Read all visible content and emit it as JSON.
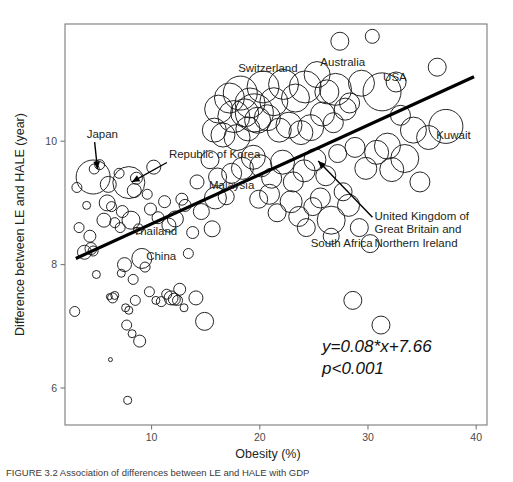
{
  "figure": {
    "caption": "FIGURE 3.2   Association of differences between LE and HALE with GDP",
    "equation_line1": "y=0.08*x+7.66",
    "equation_line2": "p<0.001"
  },
  "chart_data": {
    "type": "scatter",
    "title": "",
    "xlabel": "Obesity (%)",
    "ylabel": "Difference between LE and HALE (year)",
    "xlim": [
      2.0,
      41.0
    ],
    "ylim": [
      5.4,
      11.9
    ],
    "xticks": [
      10,
      20,
      30,
      40
    ],
    "yticks": [
      6,
      8,
      10
    ],
    "xtick_labels": [
      "10",
      "20",
      "30",
      "40"
    ],
    "ytick_labels": [
      "6",
      "8",
      "10"
    ],
    "grid": false,
    "bubble_size_note": "marker area encodes a third variable (population/GDP)",
    "trendline": {
      "slope": 0.08,
      "intercept": 7.66,
      "x_start": 3.0,
      "x_end": 39.8,
      "label": "y=0.08*x+7.66",
      "p_value": "p<0.001",
      "color": "#000000"
    },
    "annotations": [
      {
        "text": "Japan",
        "x": 4.0,
        "y": 10.05,
        "arrow_to_x": 5.0,
        "arrow_to_y": 9.55
      },
      {
        "text": "Republic of Korea",
        "x": 11.6,
        "y": 9.72,
        "arrow_to_x": 8.2,
        "arrow_to_y": 9.34
      },
      {
        "text": "Malaysia",
        "x": 15.3,
        "y": 9.22,
        "arrow_to_x": null,
        "arrow_to_y": null
      },
      {
        "text": "Thailand",
        "x": 8.3,
        "y": 8.48,
        "arrow_to_x": null,
        "arrow_to_y": null
      },
      {
        "text": "China",
        "x": 9.5,
        "y": 8.08,
        "arrow_to_x": null,
        "arrow_to_y": null
      },
      {
        "text": "Switzerland",
        "x": 18.0,
        "y": 11.12,
        "arrow_to_x": null,
        "arrow_to_y": null
      },
      {
        "text": "Australia",
        "x": 25.6,
        "y": 11.22,
        "arrow_to_x": null,
        "arrow_to_y": null
      },
      {
        "text": "USA",
        "x": 31.4,
        "y": 10.98,
        "arrow_to_x": null,
        "arrow_to_y": null
      },
      {
        "text": "Kuwait",
        "x": 36.3,
        "y": 10.04,
        "arrow_to_x": null,
        "arrow_to_y": null
      },
      {
        "text": "United Kingdom of Great Britain and Northern Ireland",
        "x": 30.6,
        "y": 8.72,
        "arrow_to_x": 25.4,
        "arrow_to_y": 9.68
      },
      {
        "text": "South Africa",
        "x": 24.7,
        "y": 8.28,
        "arrow_to_x": null,
        "arrow_to_y": null
      }
    ],
    "named_points": [
      {
        "name": "Japan",
        "x": 4.6,
        "y": 9.42,
        "r": 17
      },
      {
        "name": "Republic of Korea",
        "x": 7.9,
        "y": 9.33,
        "r": 16
      },
      {
        "name": "Malaysia",
        "x": 15.9,
        "y": 9.08,
        "r": 11
      },
      {
        "name": "Thailand",
        "x": 8.1,
        "y": 8.72,
        "r": 9
      },
      {
        "name": "China",
        "x": 9.1,
        "y": 8.1,
        "r": 10
      },
      {
        "name": "Switzerland",
        "x": 19.5,
        "y": 10.46,
        "r": 19
      },
      {
        "name": "Australia",
        "x": 27.0,
        "y": 10.84,
        "r": 16
      },
      {
        "name": "USA",
        "x": 31.3,
        "y": 10.8,
        "r": 19
      },
      {
        "name": "Kuwait",
        "x": 37.2,
        "y": 10.24,
        "r": 17
      },
      {
        "name": "United Kingdom",
        "x": 26.6,
        "y": 8.72,
        "r": 14
      },
      {
        "name": "South Africa",
        "x": 24.3,
        "y": 8.6,
        "r": 9
      }
    ],
    "points": [
      {
        "x": 3.1,
        "y": 9.25,
        "r": 5
      },
      {
        "x": 3.3,
        "y": 8.6,
        "r": 5
      },
      {
        "x": 2.9,
        "y": 7.24,
        "r": 5
      },
      {
        "x": 4.0,
        "y": 8.96,
        "r": 4
      },
      {
        "x": 4.3,
        "y": 8.46,
        "r": 6
      },
      {
        "x": 4.4,
        "y": 8.26,
        "r": 6
      },
      {
        "x": 3.8,
        "y": 8.2,
        "r": 7
      },
      {
        "x": 4.6,
        "y": 8.22,
        "r": 5
      },
      {
        "x": 4.7,
        "y": 9.55,
        "r": 5
      },
      {
        "x": 5.2,
        "y": 9.62,
        "r": 5
      },
      {
        "x": 4.9,
        "y": 7.84,
        "r": 4
      },
      {
        "x": 5.6,
        "y": 8.72,
        "r": 7
      },
      {
        "x": 5.9,
        "y": 9.0,
        "r": 8
      },
      {
        "x": 6.0,
        "y": 9.3,
        "r": 8
      },
      {
        "x": 6.3,
        "y": 8.94,
        "r": 5
      },
      {
        "x": 6.6,
        "y": 8.68,
        "r": 5
      },
      {
        "x": 6.1,
        "y": 7.48,
        "r": 3
      },
      {
        "x": 6.4,
        "y": 7.46,
        "r": 5
      },
      {
        "x": 6.6,
        "y": 7.5,
        "r": 4
      },
      {
        "x": 6.2,
        "y": 6.46,
        "r": 2
      },
      {
        "x": 7.0,
        "y": 9.48,
        "r": 5
      },
      {
        "x": 7.3,
        "y": 8.86,
        "r": 6
      },
      {
        "x": 7.1,
        "y": 8.6,
        "r": 5
      },
      {
        "x": 7.5,
        "y": 8.0,
        "r": 7
      },
      {
        "x": 7.2,
        "y": 7.86,
        "r": 4
      },
      {
        "x": 7.6,
        "y": 7.3,
        "r": 4
      },
      {
        "x": 7.9,
        "y": 7.26,
        "r": 4
      },
      {
        "x": 7.7,
        "y": 7.02,
        "r": 5
      },
      {
        "x": 7.8,
        "y": 5.8,
        "r": 4
      },
      {
        "x": 8.4,
        "y": 9.2,
        "r": 7
      },
      {
        "x": 8.6,
        "y": 9.4,
        "r": 6
      },
      {
        "x": 8.8,
        "y": 8.58,
        "r": 5
      },
      {
        "x": 8.3,
        "y": 7.76,
        "r": 5
      },
      {
        "x": 8.5,
        "y": 7.42,
        "r": 5
      },
      {
        "x": 8.2,
        "y": 6.88,
        "r": 4
      },
      {
        "x": 8.9,
        "y": 6.76,
        "r": 6
      },
      {
        "x": 9.6,
        "y": 9.14,
        "r": 5
      },
      {
        "x": 9.9,
        "y": 8.9,
        "r": 6
      },
      {
        "x": 9.4,
        "y": 7.96,
        "r": 5
      },
      {
        "x": 9.8,
        "y": 7.56,
        "r": 5
      },
      {
        "x": 10.2,
        "y": 9.58,
        "r": 7
      },
      {
        "x": 10.6,
        "y": 8.76,
        "r": 6
      },
      {
        "x": 10.4,
        "y": 7.42,
        "r": 4
      },
      {
        "x": 10.9,
        "y": 7.4,
        "r": 5
      },
      {
        "x": 11.2,
        "y": 9.02,
        "r": 6
      },
      {
        "x": 11.6,
        "y": 8.64,
        "r": 7
      },
      {
        "x": 11.4,
        "y": 7.52,
        "r": 5
      },
      {
        "x": 11.8,
        "y": 7.46,
        "r": 7
      },
      {
        "x": 12.1,
        "y": 7.44,
        "r": 6
      },
      {
        "x": 12.4,
        "y": 7.42,
        "r": 5
      },
      {
        "x": 12.2,
        "y": 8.74,
        "r": 8
      },
      {
        "x": 12.8,
        "y": 9.06,
        "r": 6
      },
      {
        "x": 12.6,
        "y": 7.6,
        "r": 6
      },
      {
        "x": 13.1,
        "y": 8.96,
        "r": 6
      },
      {
        "x": 13.4,
        "y": 8.18,
        "r": 5
      },
      {
        "x": 13.0,
        "y": 7.3,
        "r": 4
      },
      {
        "x": 13.8,
        "y": 8.52,
        "r": 6
      },
      {
        "x": 14.2,
        "y": 9.34,
        "r": 7
      },
      {
        "x": 14.6,
        "y": 8.86,
        "r": 8
      },
      {
        "x": 14.1,
        "y": 7.46,
        "r": 7
      },
      {
        "x": 14.9,
        "y": 7.08,
        "r": 9
      },
      {
        "x": 15.4,
        "y": 9.7,
        "r": 9
      },
      {
        "x": 15.8,
        "y": 10.18,
        "r": 12
      },
      {
        "x": 16.2,
        "y": 10.52,
        "r": 14
      },
      {
        "x": 16.6,
        "y": 10.1,
        "r": 12
      },
      {
        "x": 16.1,
        "y": 9.42,
        "r": 9
      },
      {
        "x": 16.9,
        "y": 9.1,
        "r": 8
      },
      {
        "x": 15.6,
        "y": 8.58,
        "r": 8
      },
      {
        "x": 17.2,
        "y": 10.7,
        "r": 15
      },
      {
        "x": 17.6,
        "y": 10.4,
        "r": 16
      },
      {
        "x": 17.9,
        "y": 10.06,
        "r": 13
      },
      {
        "x": 17.4,
        "y": 9.48,
        "r": 10
      },
      {
        "x": 18.2,
        "y": 10.78,
        "r": 17
      },
      {
        "x": 18.6,
        "y": 10.46,
        "r": 14
      },
      {
        "x": 18.9,
        "y": 10.2,
        "r": 12
      },
      {
        "x": 18.4,
        "y": 9.56,
        "r": 11
      },
      {
        "x": 19.1,
        "y": 10.62,
        "r": 15
      },
      {
        "x": 19.8,
        "y": 10.34,
        "r": 13
      },
      {
        "x": 19.4,
        "y": 9.74,
        "r": 12
      },
      {
        "x": 19.9,
        "y": 9.06,
        "r": 9
      },
      {
        "x": 20.3,
        "y": 10.88,
        "r": 16
      },
      {
        "x": 20.7,
        "y": 10.38,
        "r": 13
      },
      {
        "x": 20.1,
        "y": 9.6,
        "r": 11
      },
      {
        "x": 20.9,
        "y": 9.14,
        "r": 10
      },
      {
        "x": 21.3,
        "y": 10.64,
        "r": 14
      },
      {
        "x": 21.8,
        "y": 10.18,
        "r": 12
      },
      {
        "x": 21.1,
        "y": 9.4,
        "r": 10
      },
      {
        "x": 21.6,
        "y": 8.84,
        "r": 9
      },
      {
        "x": 22.2,
        "y": 10.92,
        "r": 15
      },
      {
        "x": 22.7,
        "y": 10.26,
        "r": 13
      },
      {
        "x": 22.1,
        "y": 9.66,
        "r": 12
      },
      {
        "x": 22.9,
        "y": 9.02,
        "r": 11
      },
      {
        "x": 23.3,
        "y": 10.7,
        "r": 14
      },
      {
        "x": 23.8,
        "y": 10.14,
        "r": 12
      },
      {
        "x": 23.1,
        "y": 9.34,
        "r": 10
      },
      {
        "x": 23.6,
        "y": 8.78,
        "r": 10
      },
      {
        "x": 24.2,
        "y": 10.88,
        "r": 16
      },
      {
        "x": 24.7,
        "y": 10.22,
        "r": 13
      },
      {
        "x": 24.1,
        "y": 9.52,
        "r": 11
      },
      {
        "x": 24.9,
        "y": 8.94,
        "r": 9
      },
      {
        "x": 25.3,
        "y": 11.08,
        "r": 13
      },
      {
        "x": 25.8,
        "y": 10.44,
        "r": 12
      },
      {
        "x": 25.1,
        "y": 9.7,
        "r": 11
      },
      {
        "x": 25.6,
        "y": 9.08,
        "r": 10
      },
      {
        "x": 26.2,
        "y": 10.8,
        "r": 12
      },
      {
        "x": 26.8,
        "y": 10.3,
        "r": 10
      },
      {
        "x": 26.1,
        "y": 9.44,
        "r": 10
      },
      {
        "x": 26.6,
        "y": 8.46,
        "r": 8
      },
      {
        "x": 27.4,
        "y": 11.62,
        "r": 9
      },
      {
        "x": 27.9,
        "y": 10.52,
        "r": 11
      },
      {
        "x": 27.2,
        "y": 9.8,
        "r": 9
      },
      {
        "x": 27.7,
        "y": 9.18,
        "r": 9
      },
      {
        "x": 28.3,
        "y": 10.62,
        "r": 10
      },
      {
        "x": 28.8,
        "y": 9.9,
        "r": 10
      },
      {
        "x": 28.2,
        "y": 8.96,
        "r": 11
      },
      {
        "x": 28.6,
        "y": 7.42,
        "r": 9
      },
      {
        "x": 29.4,
        "y": 10.94,
        "r": 13
      },
      {
        "x": 29.8,
        "y": 9.56,
        "r": 11
      },
      {
        "x": 29.2,
        "y": 8.6,
        "r": 9
      },
      {
        "x": 30.4,
        "y": 11.7,
        "r": 7
      },
      {
        "x": 30.8,
        "y": 9.82,
        "r": 12
      },
      {
        "x": 30.2,
        "y": 8.34,
        "r": 9
      },
      {
        "x": 31.8,
        "y": 9.92,
        "r": 13
      },
      {
        "x": 31.2,
        "y": 7.02,
        "r": 9
      },
      {
        "x": 32.6,
        "y": 10.96,
        "r": 10
      },
      {
        "x": 32.2,
        "y": 9.54,
        "r": 12
      },
      {
        "x": 33.4,
        "y": 9.72,
        "r": 14
      },
      {
        "x": 34.2,
        "y": 10.18,
        "r": 13
      },
      {
        "x": 35.6,
        "y": 10.06,
        "r": 12
      },
      {
        "x": 36.4,
        "y": 11.2,
        "r": 9
      },
      {
        "x": 33.0,
        "y": 10.42,
        "r": 10
      },
      {
        "x": 34.8,
        "y": 9.34,
        "r": 10
      }
    ]
  }
}
